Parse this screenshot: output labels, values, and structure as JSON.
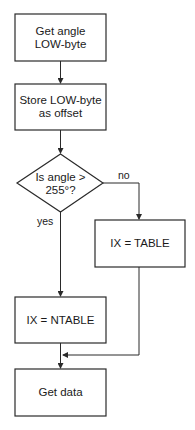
{
  "diagram": {
    "type": "flowchart",
    "nodes": [
      {
        "id": "get_angle",
        "shape": "rectangle",
        "lines": [
          "Get angle",
          "LOW-byte"
        ]
      },
      {
        "id": "store_offset",
        "shape": "rectangle",
        "lines": [
          "Store LOW-byte",
          "as offset"
        ]
      },
      {
        "id": "decision",
        "shape": "diamond",
        "lines": [
          "Is angle >",
          "255°?"
        ]
      },
      {
        "id": "ix_table",
        "shape": "rectangle",
        "lines": [
          "IX = TABLE"
        ]
      },
      {
        "id": "ix_ntable",
        "shape": "rectangle",
        "lines": [
          "IX = NTABLE"
        ]
      },
      {
        "id": "get_data",
        "shape": "rectangle",
        "lines": [
          "Get data"
        ]
      }
    ],
    "edges": [
      {
        "from": "get_angle",
        "to": "store_offset",
        "label": ""
      },
      {
        "from": "store_offset",
        "to": "decision",
        "label": ""
      },
      {
        "from": "decision",
        "to": "ix_table",
        "label": "no"
      },
      {
        "from": "decision",
        "to": "ix_ntable",
        "label": "yes"
      },
      {
        "from": "ix_ntable",
        "to": "get_data",
        "label": ""
      },
      {
        "from": "ix_table",
        "to": "get_data",
        "label": ""
      }
    ],
    "labels": {
      "no": "no",
      "yes": "yes"
    },
    "colors": {
      "stroke": "#2a2a2a",
      "background": "#ffffff",
      "text": "#1a1a1a"
    }
  }
}
